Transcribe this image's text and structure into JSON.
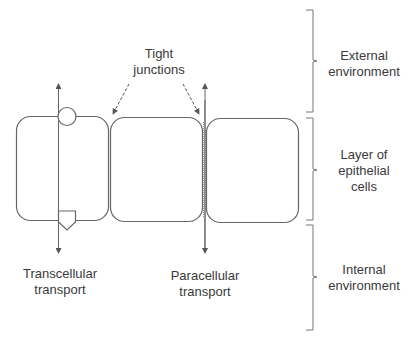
{
  "diagram": {
    "labels": {
      "tight_junctions_line1": "Tight",
      "tight_junctions_line2": "junctions",
      "transcellular_line1": "Transcellular",
      "transcellular_line2": "transport",
      "paracellular_line1": "Paracellular",
      "paracellular_line2": "transport",
      "external_line1": "External",
      "external_line2": "environment",
      "layer_line1": "Layer of",
      "layer_line2": "epithelial",
      "layer_line3": "cells",
      "internal_line1": "Internal",
      "internal_line2": "environment"
    },
    "elements": {
      "cells": 3,
      "pathways": [
        "transcellular",
        "paracellular"
      ],
      "regions": [
        "External environment",
        "Layer of epithelial cells",
        "Internal environment"
      ]
    },
    "colors": {
      "line": "#555555",
      "text": "#3a3a3a",
      "background": "#ffffff"
    }
  }
}
